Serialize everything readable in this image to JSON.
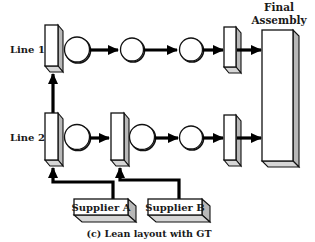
{
  "diagram": {
    "title": "Final Assembly",
    "title_lines": [
      "Final",
      "Assembly"
    ],
    "caption": "(c) Lean layout with GT",
    "lines": [
      {
        "label": "Line 1",
        "stations": [
          "cell-box",
          "machine",
          "machine",
          "machine",
          "buffer-box"
        ]
      },
      {
        "label": "Line 2",
        "stations": [
          "cell-box",
          "machine",
          "cell-box",
          "machine",
          "machine",
          "buffer-box"
        ]
      }
    ],
    "suppliers": [
      {
        "label": "Supplier A",
        "feeds": "Line 2 first cell"
      },
      {
        "label": "Supplier B",
        "feeds": "Line 2 second cell"
      }
    ],
    "connections": [
      {
        "from": "Line 2 first cell",
        "to": "Line 1 first cell"
      },
      {
        "from": "Line 1 buffer",
        "to": "Final Assembly"
      },
      {
        "from": "Line 2 buffer",
        "to": "Final Assembly"
      }
    ],
    "colors": {
      "stroke": "#111111",
      "shade_side": "#b8b8b8",
      "shade_bottom": "#d6d6d6",
      "fill": "#ffffff"
    }
  }
}
